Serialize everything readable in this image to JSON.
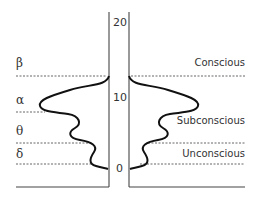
{
  "diagram": {
    "axis_ticks": [
      "20",
      "10",
      "0"
    ],
    "wave_labels": [
      {
        "symbol": "β",
        "name": "beta"
      },
      {
        "symbol": "α",
        "name": "alpha"
      },
      {
        "symbol": "θ",
        "name": "theta"
      },
      {
        "symbol": "δ",
        "name": "delta"
      }
    ],
    "zone_labels": [
      "Conscious",
      "Subconscious",
      "Unconscious"
    ],
    "colors": {
      "line": "#222222",
      "dashed": "#555555",
      "text": "#333333"
    }
  }
}
